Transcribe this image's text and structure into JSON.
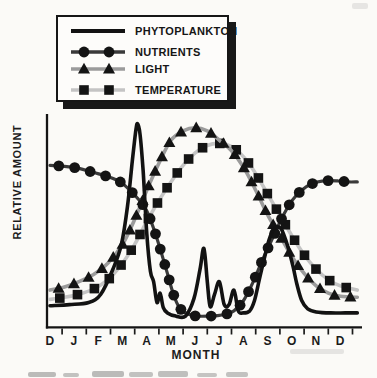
{
  "figure": {
    "y_axis_label": "RELATIVE AMOUNT",
    "x_axis_label": "MONTH"
  },
  "legend": {
    "position": "top-left",
    "items": [
      {
        "label": "PHYTOPLANKTON",
        "marker": "none",
        "color": "#121212"
      },
      {
        "label": "NUTRIENTS",
        "marker": "circle",
        "color": "#3a3a3a"
      },
      {
        "label": "LIGHT",
        "marker": "triangle",
        "color": "#9b9b9b"
      },
      {
        "label": "TEMPERATURE",
        "marker": "square",
        "color": "#c4c4c4"
      }
    ]
  },
  "chart_data": {
    "type": "line",
    "title": "",
    "xlabel": "MONTH",
    "ylabel": "RELATIVE AMOUNT",
    "categories": [
      "D",
      "J",
      "F",
      "M",
      "A",
      "M",
      "J",
      "J",
      "A",
      "S",
      "O",
      "N",
      "D"
    ],
    "x_unit": "month index (0 = first December tick, fractional = within month, curves extend to 12.7)",
    "y_unit": "relative amount, unlabeled axis, estimated scale 0-100",
    "ylim": [
      0,
      100
    ],
    "grid": false,
    "legend_position": "top-left",
    "marker_color": "#141414",
    "series": [
      {
        "name": "PHYTOPLANKTON",
        "color": "#121212",
        "marker": "none",
        "line_width": 3.6,
        "marker_spacing": 0,
        "points": [
          [
            0,
            10.5
          ],
          [
            0.8,
            11
          ],
          [
            1.6,
            12
          ],
          [
            2.1,
            16
          ],
          [
            2.6,
            28
          ],
          [
            2.95,
            40
          ],
          [
            3.2,
            58
          ],
          [
            3.4,
            80
          ],
          [
            3.55,
            95
          ],
          [
            3.62,
            98
          ],
          [
            3.72,
            93
          ],
          [
            3.85,
            75
          ],
          [
            4.0,
            45
          ],
          [
            4.15,
            27
          ],
          [
            4.28,
            22
          ],
          [
            4.42,
            12
          ],
          [
            4.55,
            16.5
          ],
          [
            4.68,
            9.5
          ],
          [
            4.85,
            7
          ],
          [
            5.2,
            5.5
          ],
          [
            5.6,
            5.5
          ],
          [
            5.95,
            14
          ],
          [
            6.2,
            28
          ],
          [
            6.36,
            38
          ],
          [
            6.5,
            22
          ],
          [
            6.62,
            10
          ],
          [
            6.8,
            16
          ],
          [
            7.0,
            22
          ],
          [
            7.2,
            11
          ],
          [
            7.4,
            11
          ],
          [
            7.6,
            18
          ],
          [
            7.78,
            8
          ],
          [
            8.0,
            7
          ],
          [
            8.25,
            8
          ],
          [
            8.45,
            13
          ],
          [
            8.65,
            23
          ],
          [
            8.85,
            33
          ],
          [
            9.05,
            42
          ],
          [
            9.25,
            47.5
          ],
          [
            9.5,
            48
          ],
          [
            9.65,
            45
          ],
          [
            9.85,
            38
          ],
          [
            10.05,
            29
          ],
          [
            10.2,
            21
          ],
          [
            10.4,
            13
          ],
          [
            10.65,
            9
          ],
          [
            11,
            7.5
          ],
          [
            11.6,
            7
          ],
          [
            12.2,
            7
          ],
          [
            12.7,
            7
          ]
        ]
      },
      {
        "name": "NUTRIENTS",
        "color": "#3a3a3a",
        "marker": "circle",
        "line_width": 3.2,
        "marker_spacing": 16,
        "points": [
          [
            0,
            78
          ],
          [
            0.6,
            77.5
          ],
          [
            1.2,
            76.5
          ],
          [
            1.8,
            74.5
          ],
          [
            2.4,
            72.5
          ],
          [
            2.9,
            70
          ],
          [
            3.3,
            66
          ],
          [
            3.7,
            61
          ],
          [
            4.0,
            56
          ],
          [
            4.3,
            47
          ],
          [
            4.6,
            36
          ],
          [
            4.85,
            26
          ],
          [
            5.1,
            16
          ],
          [
            5.35,
            9.5
          ],
          [
            5.7,
            6.5
          ],
          [
            6.1,
            5.5
          ],
          [
            6.6,
            5.5
          ],
          [
            7.1,
            6
          ],
          [
            7.6,
            8
          ],
          [
            8.0,
            13
          ],
          [
            8.4,
            22
          ],
          [
            8.8,
            33
          ],
          [
            9.2,
            43
          ],
          [
            9.6,
            53
          ],
          [
            10.0,
            61
          ],
          [
            10.4,
            66
          ],
          [
            10.8,
            69
          ],
          [
            11.3,
            70.5
          ],
          [
            11.9,
            70.5
          ],
          [
            12.3,
            70
          ],
          [
            12.7,
            70
          ]
        ]
      },
      {
        "name": "LIGHT",
        "color": "#9b9b9b",
        "marker": "triangle",
        "line_width": 3.6,
        "marker_spacing": 16,
        "points": [
          [
            0,
            18
          ],
          [
            0.6,
            19.5
          ],
          [
            1.2,
            22
          ],
          [
            1.8,
            25.5
          ],
          [
            2.4,
            31
          ],
          [
            3.0,
            40
          ],
          [
            3.5,
            52
          ],
          [
            4.0,
            66
          ],
          [
            4.5,
            79
          ],
          [
            5.0,
            90
          ],
          [
            5.5,
            94.5
          ],
          [
            6.0,
            96
          ],
          [
            6.5,
            94.5
          ],
          [
            7.0,
            90
          ],
          [
            7.5,
            85
          ],
          [
            8.0,
            77
          ],
          [
            8.5,
            66
          ],
          [
            9.0,
            54
          ],
          [
            9.5,
            44
          ],
          [
            10.0,
            34
          ],
          [
            10.5,
            26
          ],
          [
            11.0,
            20
          ],
          [
            11.5,
            16.5
          ],
          [
            12.0,
            15
          ],
          [
            12.7,
            14.5
          ]
        ]
      },
      {
        "name": "TEMPERATURE",
        "color": "#c4c4c4",
        "marker": "square",
        "line_width": 3.6,
        "marker_spacing": 18,
        "points": [
          [
            0,
            13.5
          ],
          [
            0.6,
            14.5
          ],
          [
            1.2,
            16
          ],
          [
            1.8,
            18.5
          ],
          [
            2.4,
            23
          ],
          [
            3.0,
            31
          ],
          [
            3.5,
            40
          ],
          [
            4.0,
            51
          ],
          [
            4.5,
            61
          ],
          [
            5.0,
            70
          ],
          [
            5.5,
            78
          ],
          [
            6.0,
            84
          ],
          [
            6.5,
            87.5
          ],
          [
            7.0,
            88.5
          ],
          [
            7.5,
            87
          ],
          [
            8.0,
            82
          ],
          [
            8.5,
            74
          ],
          [
            9.0,
            64
          ],
          [
            9.5,
            54
          ],
          [
            10.0,
            44
          ],
          [
            10.5,
            35
          ],
          [
            11.0,
            28
          ],
          [
            11.5,
            23
          ],
          [
            12.0,
            20
          ],
          [
            12.7,
            18
          ]
        ]
      }
    ]
  }
}
